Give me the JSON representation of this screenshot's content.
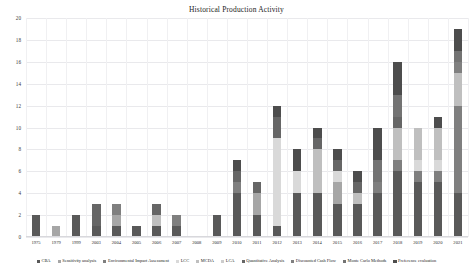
{
  "chart_data": {
    "type": "bar",
    "stacked": true,
    "title": "Historical Production Activity",
    "xlabel": "",
    "ylabel": "",
    "ylim": [
      0,
      20
    ],
    "ytick_step": 2,
    "yticks": [
      0,
      2,
      4,
      6,
      8,
      10,
      12,
      14,
      16,
      18,
      20
    ],
    "grid": true,
    "legend_position": "bottom",
    "categories": [
      "1975",
      "1979",
      "1999",
      "2003",
      "2004",
      "2005",
      "2006",
      "2007",
      "2008",
      "2009",
      "2010",
      "2011",
      "2012",
      "2013",
      "2014",
      "2015",
      "2016",
      "2017",
      "2018",
      "2019",
      "2020",
      "2021"
    ],
    "series": [
      {
        "name": "CBA",
        "color": "#595959",
        "values": [
          2,
          0,
          2,
          1,
          1,
          1,
          1,
          1,
          0,
          2,
          4,
          2,
          1,
          4,
          4,
          3,
          3,
          4,
          6,
          5,
          5,
          4
        ]
      },
      {
        "name": "Sensitivity analysis",
        "color": "#a6a6a6",
        "values": [
          0,
          1,
          0,
          0,
          1,
          0,
          0,
          0,
          0,
          0,
          0,
          2,
          0,
          0,
          0,
          2,
          0,
          0,
          0,
          0,
          0,
          0
        ]
      },
      {
        "name": "Environmental Impact Assessment",
        "color": "#7f7f7f",
        "values": [
          0,
          0,
          0,
          0,
          1,
          0,
          0,
          1,
          0,
          0,
          1,
          0,
          0,
          0,
          0,
          0,
          0,
          1,
          1,
          1,
          1,
          8
        ]
      },
      {
        "name": "LCC",
        "color": "#d9d9d9",
        "values": [
          0,
          0,
          0,
          0,
          0,
          0,
          0,
          0,
          0,
          0,
          0,
          0,
          8,
          2,
          0,
          1,
          0,
          0,
          0,
          1,
          1,
          0
        ]
      },
      {
        "name": "MCDA",
        "color": "#bfbfbf",
        "values": [
          0,
          0,
          0,
          0,
          0,
          0,
          1,
          0,
          0,
          0,
          0,
          0,
          0,
          0,
          4,
          0,
          1,
          0,
          3,
          3,
          3,
          3
        ]
      },
      {
        "name": "LCA",
        "color": "#cccccc",
        "values": [
          0,
          0,
          0,
          0,
          0,
          0,
          0,
          0,
          0,
          0,
          0,
          0,
          0,
          0,
          0,
          0,
          0,
          0,
          0,
          0,
          0,
          0
        ]
      },
      {
        "name": "Quantitative Analysis",
        "color": "#666666",
        "values": [
          0,
          0,
          0,
          2,
          0,
          0,
          1,
          0,
          0,
          0,
          1,
          1,
          2,
          0,
          1,
          1,
          1,
          0,
          1,
          0,
          0,
          0
        ]
      },
      {
        "name": "Discounted Cash Flow",
        "color": "#808080",
        "values": [
          0,
          0,
          0,
          0,
          0,
          0,
          0,
          0,
          0,
          0,
          0,
          0,
          0,
          0,
          0,
          0,
          0,
          0,
          0,
          0,
          0,
          1
        ]
      },
      {
        "name": "Monte Carlo Methods",
        "color": "#737373",
        "values": [
          0,
          0,
          0,
          0,
          0,
          0,
          0,
          0,
          0,
          0,
          0,
          0,
          0,
          0,
          0,
          0,
          0,
          2,
          2,
          0,
          0,
          1
        ]
      },
      {
        "name": "Preference evaluation",
        "color": "#4d4d4d",
        "values": [
          0,
          0,
          0,
          0,
          0,
          0,
          0,
          0,
          0,
          0,
          1,
          0,
          1,
          2,
          1,
          1,
          1,
          3,
          3,
          0,
          1,
          2
        ]
      }
    ],
    "totals": [
      2,
      1,
      2,
      3,
      3,
      1,
      3,
      2,
      0,
      2,
      7,
      5,
      12,
      8,
      10,
      8,
      6,
      10,
      16,
      10,
      11,
      19
    ]
  }
}
